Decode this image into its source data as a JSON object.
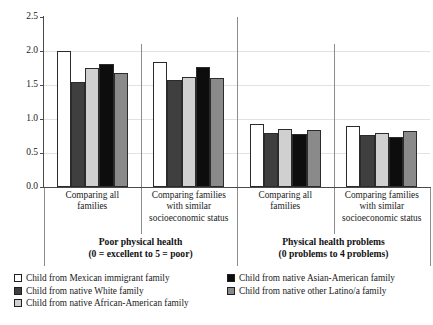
{
  "chart_data": {
    "type": "bar",
    "title": "",
    "xlabel": "",
    "ylabel": "",
    "ylim": [
      0,
      2.5
    ],
    "yticks": [
      "0.0",
      "0.5",
      "1.0",
      "1.5",
      "2.0",
      "2.5"
    ],
    "grid": true,
    "legend_position": "bottom",
    "categories": [
      "Comparing all families",
      "Comparing families with similar socioeconomic status",
      "Comparing all families",
      "Comparing families with similar socioeconomic status"
    ],
    "category_lines": [
      [
        "Comparing all",
        "families"
      ],
      [
        "Comparing families",
        "with similar",
        "socioeconomic status"
      ],
      [
        "Comparing all",
        "families"
      ],
      [
        "Comparing families",
        "with similar",
        "socioeconomic status"
      ]
    ],
    "panels": [
      {
        "title": "Poor physical health",
        "subtitle": "(0 = excellent to 5 = poor)",
        "categories": [
          0,
          1
        ]
      },
      {
        "title": "Physical health problems",
        "subtitle": "(0 problems to 4 problems)",
        "categories": [
          2,
          3
        ]
      }
    ],
    "series": [
      {
        "name": "Child from Mexican immigrant family",
        "color": "#ffffff",
        "values": [
          2.0,
          1.84,
          0.93,
          0.9
        ]
      },
      {
        "name": "Child from native White family",
        "color": "#3f3f3f",
        "values": [
          1.55,
          1.57,
          0.79,
          0.76
        ]
      },
      {
        "name": "Child from native African-American family",
        "color": "#d0d0d0",
        "values": [
          1.75,
          1.62,
          0.86,
          0.79
        ]
      },
      {
        "name": "Child from native Asian-American family",
        "color": "#0d0d0d",
        "values": [
          1.81,
          1.77,
          0.78,
          0.74
        ]
      },
      {
        "name": "Child from native other Latino/a family",
        "color": "#8a8a8a",
        "values": [
          1.68,
          1.61,
          0.84,
          0.82
        ]
      }
    ]
  },
  "legend": {
    "left_column": [
      {
        "label": "Child from Mexican immigrant family",
        "color": "#ffffff"
      },
      {
        "label": "Child from native White family",
        "color": "#3f3f3f"
      },
      {
        "label": "Child from native African-American family",
        "color": "#d0d0d0"
      }
    ],
    "right_column": [
      {
        "label": "Child from native Asian-American family",
        "color": "#0d0d0d"
      },
      {
        "label": "Child from native other Latino/a family",
        "color": "#8a8a8a"
      }
    ]
  }
}
